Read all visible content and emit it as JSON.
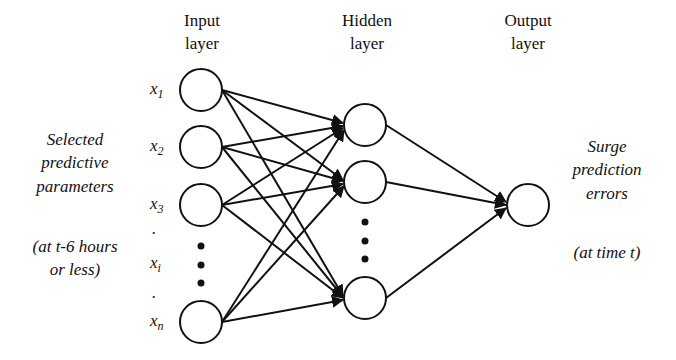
{
  "layers": {
    "input": {
      "line1": "Input",
      "line2": "layer"
    },
    "hidden": {
      "line1": "Hidden",
      "line2": "layer"
    },
    "output": {
      "line1": "Output",
      "line2": "layer"
    }
  },
  "left_annotation": {
    "lines": [
      "Selected",
      "predictive",
      "parameters"
    ],
    "time_lines": [
      "(at t-6 hours",
      "or less)"
    ]
  },
  "right_annotation": {
    "lines": [
      "Surge",
      "prediction",
      "errors"
    ],
    "time_lines": [
      "(at time t)"
    ]
  },
  "input_nodes": [
    {
      "var": "x",
      "sub": "1",
      "cx": 201,
      "cy": 90
    },
    {
      "var": "x",
      "sub": "2",
      "cx": 201,
      "cy": 147
    },
    {
      "var": "x",
      "sub": "3",
      "cx": 201,
      "cy": 205
    },
    {
      "var": "x",
      "sub": "n",
      "cx": 201,
      "cy": 322
    }
  ],
  "input_ellipsis_label": {
    "var": "x",
    "sub": "i"
  },
  "hidden_nodes": [
    {
      "cx": 365,
      "cy": 125
    },
    {
      "cx": 365,
      "cy": 182
    },
    {
      "cx": 365,
      "cy": 298
    }
  ],
  "output_node": {
    "cx": 528,
    "cy": 205
  },
  "colors": {
    "stroke": "#111111",
    "background": "#ffffff"
  }
}
